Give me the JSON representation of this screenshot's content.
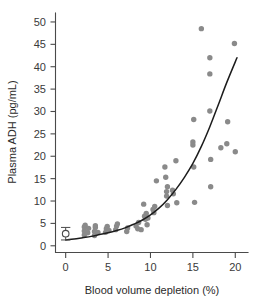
{
  "chart_data": {
    "type": "scatter",
    "title": "",
    "xlabel": "Blood volume depletion (%)",
    "ylabel": "Plasma ADH (pg/mL)",
    "xlim": [
      -1.2,
      21.5
    ],
    "ylim": [
      -1.5,
      52
    ],
    "xticks": [
      0,
      5,
      10,
      15,
      20
    ],
    "yticks": [
      0,
      5,
      10,
      15,
      20,
      25,
      30,
      35,
      40,
      45,
      50
    ],
    "xticklabels": [
      "0",
      "5",
      "10",
      "15",
      "20"
    ],
    "yticklabels": [
      "0",
      "5",
      "10",
      "15",
      "20",
      "25",
      "30",
      "35",
      "40",
      "45",
      "50"
    ],
    "grid": false,
    "legend": false,
    "legend_position": "none",
    "series": [
      {
        "name": "Plasma ADH observations",
        "marker": "filled-circle",
        "color": "#8a8a8a",
        "points": [
          [
            2.2,
            2.4
          ],
          [
            2.2,
            3.3
          ],
          [
            2.2,
            4.2
          ],
          [
            2.3,
            4.6
          ],
          [
            2.6,
            2.9
          ],
          [
            2.7,
            3.9
          ],
          [
            3.4,
            2.3
          ],
          [
            3.4,
            3.2
          ],
          [
            3.5,
            4.1
          ],
          [
            3.5,
            4.5
          ],
          [
            3.8,
            3.0
          ],
          [
            4.7,
            3.0
          ],
          [
            4.8,
            3.8
          ],
          [
            4.9,
            4.3
          ],
          [
            5.1,
            3.4
          ],
          [
            5.9,
            3.6
          ],
          [
            6.0,
            4.4
          ],
          [
            6.1,
            4.9
          ],
          [
            7.2,
            3.2
          ],
          [
            7.3,
            4.0
          ],
          [
            8.3,
            4.4
          ],
          [
            8.5,
            3.8
          ],
          [
            8.6,
            5.2
          ],
          [
            8.9,
            3.6
          ],
          [
            9.2,
            9.3
          ],
          [
            9.3,
            6.6
          ],
          [
            9.4,
            5.9
          ],
          [
            9.5,
            7.2
          ],
          [
            9.6,
            4.7
          ],
          [
            9.7,
            6.2
          ],
          [
            10.3,
            8.1
          ],
          [
            10.4,
            7.4
          ],
          [
            10.5,
            8.8
          ],
          [
            10.7,
            14.5
          ],
          [
            11.7,
            17.6
          ],
          [
            11.8,
            15.3
          ],
          [
            11.9,
            12.1
          ],
          [
            11.9,
            11.1
          ],
          [
            12.0,
            9.0
          ],
          [
            12.0,
            13.2
          ],
          [
            12.6,
            12.4
          ],
          [
            12.7,
            11.6
          ],
          [
            13.0,
            19.0
          ],
          [
            13.1,
            9.6
          ],
          [
            15.0,
            23.2
          ],
          [
            15.0,
            22.5
          ],
          [
            15.1,
            17.6
          ],
          [
            15.1,
            28.2
          ],
          [
            15.2,
            9.7
          ],
          [
            16.0,
            48.5
          ],
          [
            17.0,
            42.0
          ],
          [
            17.0,
            38.4
          ],
          [
            17.0,
            30.1
          ],
          [
            17.1,
            19.3
          ],
          [
            17.1,
            13.2
          ],
          [
            18.3,
            21.9
          ],
          [
            19.0,
            22.8
          ],
          [
            19.1,
            27.7
          ],
          [
            19.9,
            45.2
          ],
          [
            20.0,
            21.0
          ]
        ]
      }
    ],
    "fit_curve": {
      "name": "Exponential fit",
      "color": "#1c1c1c",
      "x_start": 0.0,
      "x_end": 20.2,
      "points": [
        [
          0.0,
          1.3
        ],
        [
          1.0,
          1.5
        ],
        [
          2.0,
          1.8
        ],
        [
          3.0,
          2.1
        ],
        [
          4.0,
          2.5
        ],
        [
          5.0,
          2.9
        ],
        [
          6.0,
          3.4
        ],
        [
          7.0,
          4.0
        ],
        [
          8.0,
          4.8
        ],
        [
          9.0,
          5.7
        ],
        [
          10.0,
          6.9
        ],
        [
          11.0,
          8.4
        ],
        [
          12.0,
          10.3
        ],
        [
          13.0,
          12.6
        ],
        [
          14.0,
          15.3
        ],
        [
          15.0,
          18.4
        ],
        [
          16.0,
          22.2
        ],
        [
          17.0,
          26.6
        ],
        [
          18.0,
          31.5
        ],
        [
          19.0,
          36.5
        ],
        [
          20.2,
          42.0
        ]
      ]
    },
    "reference_marker": {
      "name": "Baseline mean with error bars",
      "marker": "open-circle",
      "x": 0.0,
      "y": 2.7,
      "yerr_low": 1.3,
      "yerr_high": 4.1,
      "cap_halfwidth": 0.55
    }
  }
}
